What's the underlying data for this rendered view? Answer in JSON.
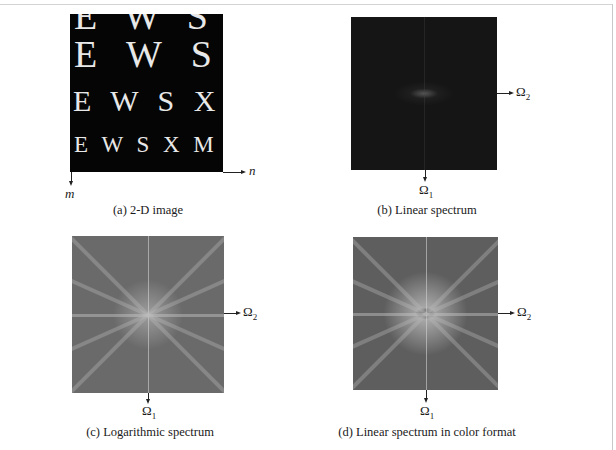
{
  "figure": {
    "panels": [
      {
        "id": "a",
        "caption": "(a) 2-D image",
        "image_rows": [
          "E W S Y",
          "E W S X",
          "E W S X M",
          "E W S X M P"
        ],
        "axis_horizontal": "n",
        "axis_vertical": "m"
      },
      {
        "id": "b",
        "caption": "(b) Linear spectrum",
        "axis_horizontal": "Ω",
        "axis_horizontal_sub": "2",
        "axis_vertical": "Ω",
        "axis_vertical_sub": "1"
      },
      {
        "id": "c",
        "caption": "(c) Logarithmic spectrum",
        "axis_horizontal": "Ω",
        "axis_horizontal_sub": "2",
        "axis_vertical": "Ω",
        "axis_vertical_sub": "1"
      },
      {
        "id": "d",
        "caption": "(d) Linear spectrum in color format",
        "axis_horizontal": "Ω",
        "axis_horizontal_sub": "2",
        "axis_vertical": "Ω",
        "axis_vertical_sub": "1"
      }
    ]
  }
}
